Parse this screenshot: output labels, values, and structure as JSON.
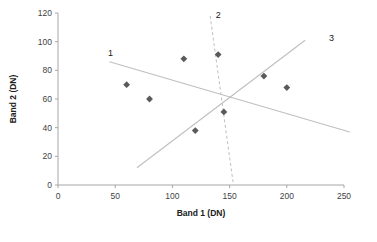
{
  "chart_data": {
    "type": "scatter",
    "title": "",
    "xlabel": "Band 1 (DN)",
    "ylabel": "Band 2 (DN)",
    "xlim": [
      0,
      250
    ],
    "ylim": [
      0,
      120
    ],
    "xticks": [
      0,
      50,
      100,
      150,
      200,
      250
    ],
    "yticks": [
      0,
      20,
      40,
      60,
      80,
      100,
      120
    ],
    "grid": false,
    "legend": "none",
    "marker_color": "#5a5a5a",
    "marker_shape": "diamond",
    "series": [
      {
        "name": "samples",
        "points": [
          {
            "x": 60,
            "y": 70
          },
          {
            "x": 80,
            "y": 60
          },
          {
            "x": 110,
            "y": 88
          },
          {
            "x": 140,
            "y": 91
          },
          {
            "x": 120,
            "y": 38
          },
          {
            "x": 145,
            "y": 51
          },
          {
            "x": 180,
            "y": 76
          },
          {
            "x": 200,
            "y": 68
          }
        ]
      }
    ],
    "annotations": [
      {
        "label": "1",
        "kind": "boundary-line",
        "style": "solid",
        "color": "#bfbfbf",
        "x1": 45,
        "y1": 86,
        "x2": 255,
        "y2": 37,
        "label_x": 46,
        "label_y": 92
      },
      {
        "label": "2",
        "kind": "boundary-line",
        "style": "dashed",
        "color": "#bfbfbf",
        "x1": 133,
        "y1": 118,
        "x2": 153,
        "y2": 2,
        "label_x": 140,
        "label_y": 118
      },
      {
        "label": "3",
        "kind": "boundary-line",
        "style": "solid",
        "color": "#bfbfbf",
        "x1": 69,
        "y1": 12,
        "x2": 216,
        "y2": 101,
        "label_x": 239,
        "label_y": 102
      }
    ]
  },
  "axis": {
    "x_tick_labels": [
      "0",
      "50",
      "100",
      "150",
      "200",
      "250"
    ],
    "y_tick_labels": [
      "0",
      "20",
      "40",
      "60",
      "80",
      "100",
      "120"
    ],
    "x_title": "Band 1 (DN)",
    "y_title": "Band 2 (DN)"
  },
  "lines": {
    "l1": "1",
    "l2": "2",
    "l3": "3"
  }
}
